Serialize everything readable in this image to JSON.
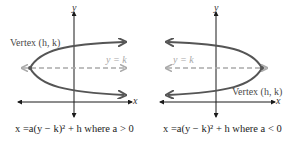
{
  "colors": {
    "axis": "#1a1a1a",
    "curve": "#555555",
    "dashed": "#aaaaaa",
    "label": "#4a4a4a",
    "label_light": "#a8a8a8"
  },
  "left_panel": {
    "y_axis_label": "y",
    "x_axis_label": "x",
    "vertex_label": "Vertex (h, k)",
    "axis_of_symmetry_label": "y = k",
    "caption": "x =a(y − k)² + h where a > 0"
  },
  "right_panel": {
    "y_axis_label": "y",
    "x_axis_label": "x",
    "vertex_label": "Vertex (h, k)",
    "axis_of_symmetry_label": "y = k",
    "caption": "x =a(y − k)² + h where a < 0"
  }
}
